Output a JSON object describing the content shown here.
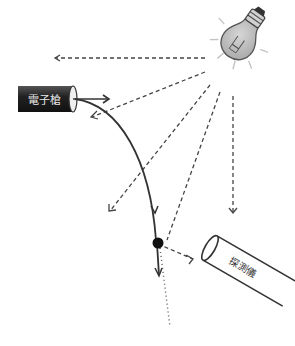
{
  "diagram": {
    "electron_gun": {
      "label": "電子槍",
      "body_color": "#2b2b2b",
      "text_color": "#e6e6e6"
    },
    "detector": {
      "label": "探測儀"
    },
    "light_bulb": {
      "fill": "#bdbdbd",
      "base_color": "#333333"
    },
    "particle": {
      "color": "#111111"
    },
    "colors": {
      "line": "#333333",
      "dash": "#444444",
      "rays": "#bbbbbb"
    }
  }
}
